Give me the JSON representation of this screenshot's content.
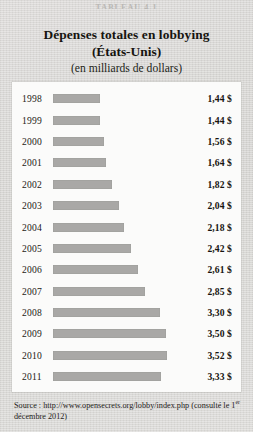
{
  "top_caption": "TABLEAU 4.1",
  "title": {
    "line1": "Dépenses totales en lobbying",
    "line2": "(États-Unis)",
    "line3": "(en milliards de dollars)"
  },
  "source": {
    "prefix": "Source : http://www.opensecrets.org/lobby/index.php (consulté le 1",
    "ordinal": "er",
    "suffix": " décembre 2012)"
  },
  "colors": {
    "background": "#d9d8d6",
    "panel": "#fbfbfa",
    "bar": "#a9a8a6",
    "text": "#16140f"
  },
  "chart_data": {
    "type": "bar",
    "orientation": "horizontal",
    "title": "Dépenses totales en lobbying (États-Unis)",
    "subtitle": "(en milliards de dollars)",
    "xlabel": "Milliards de dollars",
    "ylabel": "Année",
    "grid": false,
    "legend": "none",
    "xlim": [
      0,
      3.6
    ],
    "currency_symbol": "$",
    "decimal_separator": ",",
    "categories": [
      "1998",
      "1999",
      "2000",
      "2001",
      "2002",
      "2003",
      "2004",
      "2005",
      "2006",
      "2007",
      "2008",
      "2009",
      "2010",
      "2011"
    ],
    "values": [
      1.44,
      1.44,
      1.56,
      1.64,
      1.82,
      2.04,
      2.18,
      2.42,
      2.61,
      2.85,
      3.3,
      3.5,
      3.52,
      3.33
    ],
    "value_labels": [
      "1,44 $",
      "1,44 $",
      "1,56 $",
      "1,64 $",
      "1,82 $",
      "2,04 $",
      "2,18 $",
      "2,42 $",
      "2,61 $",
      "2,85 $",
      "3,30 $",
      "3,50 $",
      "3,52 $",
      "3,33 $"
    ],
    "rows": [
      {
        "year": "1998",
        "value": 1.44,
        "label": "1,44 $"
      },
      {
        "year": "1999",
        "value": 1.44,
        "label": "1,44 $"
      },
      {
        "year": "2000",
        "value": 1.56,
        "label": "1,56 $"
      },
      {
        "year": "2001",
        "value": 1.64,
        "label": "1,64 $"
      },
      {
        "year": "2002",
        "value": 1.82,
        "label": "1,82 $"
      },
      {
        "year": "2003",
        "value": 2.04,
        "label": "2,04 $"
      },
      {
        "year": "2004",
        "value": 2.18,
        "label": "2,18 $"
      },
      {
        "year": "2005",
        "value": 2.42,
        "label": "2,42 $"
      },
      {
        "year": "2006",
        "value": 2.61,
        "label": "2,61 $"
      },
      {
        "year": "2007",
        "value": 2.85,
        "label": "2,85 $"
      },
      {
        "year": "2008",
        "value": 3.3,
        "label": "3,30 $"
      },
      {
        "year": "2009",
        "value": 3.5,
        "label": "3,50 $"
      },
      {
        "year": "2010",
        "value": 3.52,
        "label": "3,52 $"
      },
      {
        "year": "2011",
        "value": 3.33,
        "label": "3,33 $"
      }
    ]
  }
}
